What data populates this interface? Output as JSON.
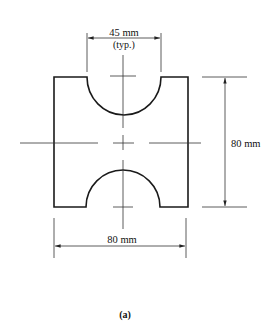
{
  "figure": {
    "caption": "(a)",
    "dimensions": {
      "notch_width": "45 mm",
      "notch_note": "(typ.)",
      "height": "80 mm",
      "width": "80 mm"
    },
    "colors": {
      "line": "#1a1a1a",
      "background": "#ffffff"
    }
  }
}
